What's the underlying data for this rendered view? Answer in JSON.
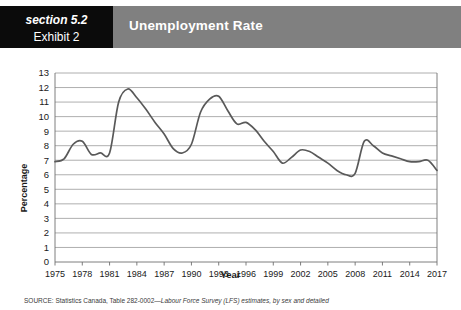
{
  "header": {
    "section_label": "section 5.2",
    "exhibit_label": "Exhibit 2",
    "title": "Unemployment Rate",
    "band_color": "#808080",
    "box_color": "#0b0b0b",
    "title_color": "#ffffff"
  },
  "source": {
    "prefix": "SOURCE: Statistics Canada, Table 282-0002—",
    "italic": "Labour Force Survey (LFS) estimates, by sex and detailed"
  },
  "chart_data": {
    "type": "line",
    "title": "Unemployment Rate",
    "xlabel": "Year",
    "ylabel": "Percentage",
    "xlim": [
      1975,
      2017
    ],
    "ylim": [
      0,
      13
    ],
    "grid": true,
    "legend": "none",
    "line_color": "#595959",
    "y_ticks": [
      0,
      1,
      2,
      3,
      4,
      5,
      6,
      7,
      8,
      9,
      10,
      11,
      12,
      13
    ],
    "x_ticks": [
      1975,
      1978,
      1981,
      1984,
      1987,
      1990,
      1993,
      1996,
      1999,
      2002,
      2005,
      2008,
      2011,
      2014,
      2017
    ],
    "x": [
      1975,
      1976,
      1977,
      1978,
      1979,
      1980,
      1981,
      1982,
      1983,
      1984,
      1985,
      1986,
      1987,
      1988,
      1989,
      1990,
      1991,
      1992,
      1993,
      1994,
      1995,
      1996,
      1997,
      1998,
      1999,
      2000,
      2001,
      2002,
      2003,
      2004,
      2005,
      2006,
      2007,
      2008,
      2009,
      2010,
      2011,
      2012,
      2013,
      2014,
      2015,
      2016,
      2017
    ],
    "values": [
      6.9,
      7.1,
      8.1,
      8.3,
      7.4,
      7.5,
      7.5,
      11.0,
      11.9,
      11.3,
      10.5,
      9.6,
      8.8,
      7.8,
      7.5,
      8.1,
      10.3,
      11.2,
      11.4,
      10.4,
      9.5,
      9.6,
      9.1,
      8.3,
      7.6,
      6.8,
      7.2,
      7.7,
      7.6,
      7.2,
      6.8,
      6.3,
      6.0,
      6.1,
      8.3,
      8.0,
      7.5,
      7.3,
      7.1,
      6.9,
      6.9,
      7.0,
      6.3
    ]
  }
}
